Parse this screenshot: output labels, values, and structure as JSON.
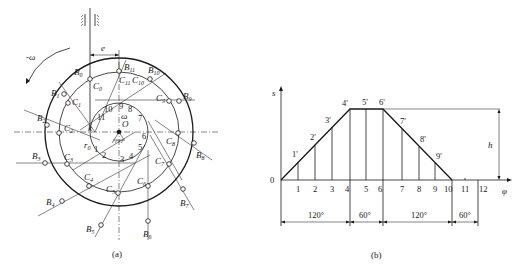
{
  "figure_a": {
    "caption": "(a)",
    "omega_label": "-ω",
    "omega_center_label": "ω",
    "center_label": "O",
    "offset_label": "e",
    "base_radius_label": "r0",
    "k_label": "k",
    "B_points": [
      "B0",
      "B1",
      "B2",
      "B3",
      "B4",
      "B5",
      "B6",
      "B7",
      "B8",
      "B9",
      "B10",
      "B11"
    ],
    "C_points": [
      "C0",
      "C1",
      "C2",
      "C3",
      "C4",
      "C5",
      "C6",
      "C7",
      "C8",
      "C9",
      "C10",
      "C11"
    ],
    "division_numbers": [
      "1",
      "2",
      "3",
      "4",
      "5",
      "6",
      "7",
      "8",
      "9",
      "10",
      "11"
    ]
  },
  "figure_b": {
    "caption": "(b)",
    "y_axis_label": "s",
    "x_axis_label": "φ",
    "origin_label": "0",
    "h_label": "h",
    "x_ticks": [
      "1",
      "2",
      "3",
      "4",
      "5",
      "6",
      "7",
      "8",
      "9",
      "10",
      "11",
      "12"
    ],
    "point_labels": [
      "1'",
      "2'",
      "3'",
      "4'",
      "5'",
      "6'",
      "7'",
      "8'",
      "9'"
    ],
    "segments": [
      "120°",
      "60°",
      "120°",
      "60°"
    ]
  }
}
